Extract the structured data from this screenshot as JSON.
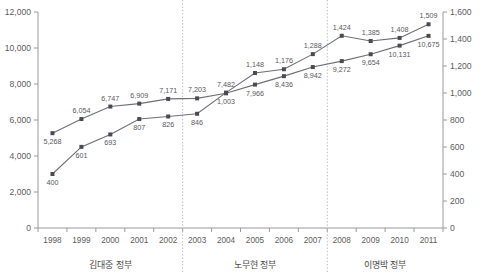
{
  "chart_data": {
    "type": "line",
    "title": "",
    "xlabel": "",
    "grid": false,
    "legend": "none",
    "categories": [
      "1998",
      "1999",
      "2000",
      "2001",
      "2002",
      "2003",
      "2004",
      "2005",
      "2006",
      "2007",
      "2008",
      "2009",
      "2010",
      "2011"
    ],
    "axes": {
      "left": {
        "label": "",
        "ylim": [
          0,
          12000
        ],
        "ticks": [
          0,
          2000,
          4000,
          6000,
          8000,
          10000,
          12000
        ],
        "tick_labels": [
          "0",
          "2,000",
          "4,000",
          "6,000",
          "8,000",
          "10,000",
          "12,000"
        ]
      },
      "right": {
        "label": "",
        "ylim": [
          0,
          1600
        ],
        "ticks": [
          0,
          200,
          400,
          600,
          800,
          1000,
          1200,
          1400,
          1600
        ],
        "tick_labels": [
          "0",
          "200",
          "400",
          "600",
          "800",
          "1,000",
          "1,200",
          "1,400",
          "1,600"
        ]
      }
    },
    "series": [
      {
        "name": "left-axis-series",
        "axis": "left",
        "values": [
          5268,
          6054,
          6747,
          6909,
          7171,
          7203,
          7482,
          7966,
          8436,
          8942,
          9272,
          9654,
          10131,
          10675
        ],
        "value_labels": [
          "5,268",
          "6,054",
          "6,747",
          "6,909",
          "7,171",
          "7,203",
          "7,482",
          "7,966",
          "8,436",
          "8,942",
          "9,272",
          "9,654",
          "10,131",
          "10,675"
        ],
        "label_positions": [
          "below",
          "above",
          "above",
          "above",
          "above",
          "above",
          "above",
          "below",
          "below",
          "below",
          "below",
          "below",
          "below",
          "below"
        ]
      },
      {
        "name": "right-axis-series",
        "axis": "right",
        "values": [
          400,
          601,
          693,
          807,
          826,
          846,
          1003,
          1148,
          1176,
          1288,
          1424,
          1385,
          1408,
          1509
        ],
        "value_labels": [
          "400",
          "601",
          "693",
          "807",
          "826",
          "846",
          "1,003",
          "1,148",
          "1,176",
          "1,288",
          "1,424",
          "1,385",
          "1,408",
          "1,509"
        ],
        "label_positions": [
          "below",
          "below",
          "below",
          "below",
          "below",
          "below",
          "below",
          "above",
          "above",
          "above",
          "above",
          "above",
          "above",
          "above"
        ]
      }
    ],
    "annotations": [
      {
        "name": "era-kim-dae-jung",
        "text": "김대중 정부",
        "start": "1998",
        "end": "2002"
      },
      {
        "name": "era-roh-moo-hyun",
        "text": "노무현 정부",
        "start": "2003",
        "end": "2007"
      },
      {
        "name": "era-lee-myung-bak",
        "text": "이명박 정부",
        "start": "2008",
        "end": "2011"
      }
    ],
    "dividers": [
      "2002/2003",
      "2007/2008"
    ],
    "colors": {
      "line": "#6e6e78",
      "marker": "#4a4a52",
      "axis": "#9a9a9a",
      "divider": "#bdbdbd",
      "text": "#5c5c5c"
    }
  }
}
